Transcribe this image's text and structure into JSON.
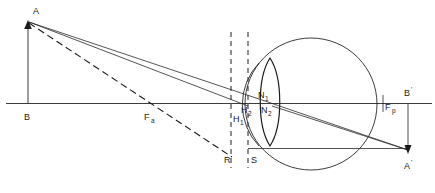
{
  "diagram": {
    "labels": {
      "object_top": "A",
      "object_base": "B",
      "anterior_focal_point": "F",
      "anterior_focal_sub": "a",
      "posterior_focal_point": "F",
      "posterior_focal_sub": "p",
      "principal_plane_1": "H",
      "principal_plane_1_sub": "1",
      "principal_plane_2": "H",
      "principal_plane_2_sub": "2",
      "nodal_point_1": "N",
      "nodal_point_1_sub": "1",
      "nodal_point_2": "N",
      "nodal_point_2_sub": "2",
      "ref_point_r": "R",
      "ref_point_s": "S",
      "image_top": "B",
      "image_top_prime": "'",
      "image_base": "A",
      "image_base_prime": "'"
    },
    "colors": {
      "ink": "#1a1a1a",
      "background": "#ffffff",
      "ray": "#2a2a2a"
    },
    "elements": {
      "optic_axis": "optic-axis-line",
      "object_arrow": "object-arrow-AB",
      "image_arrow": "image-arrow-B-A-prime",
      "eyeball": "eyeball-circle",
      "lens": "crystalline-lens",
      "cornea": "cornea-arc",
      "principal_plane_line_1": "dashed-vertical-H1",
      "principal_plane_line_2": "dashed-vertical-H2",
      "chief_ray": "chief-ray-solid",
      "focal_ray": "focal-ray-dashed"
    }
  }
}
